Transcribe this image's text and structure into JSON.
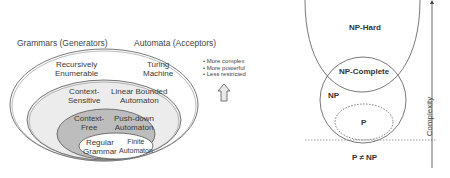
{
  "chomsky": {
    "header_grammars": "Grammars (Generators)",
    "header_automata": "Automata (Acceptors)",
    "levels": [
      {
        "grammar": [
          "Recursively",
          "Enumerable"
        ],
        "automaton": [
          "Turing",
          "Machine"
        ],
        "fill": "#ffffff"
      },
      {
        "grammar": [
          "Context-",
          "Sensitive"
        ],
        "automaton": [
          "Linear Bounded",
          "Automaton"
        ],
        "fill": "#ececec"
      },
      {
        "grammar": [
          "Context-",
          "Free"
        ],
        "automaton": [
          "Push-down",
          "Automaton"
        ],
        "fill": "#bdbdbd"
      },
      {
        "grammar": [
          "Regular",
          "Grammar"
        ],
        "automaton": [
          "Finite",
          "Automaton"
        ],
        "fill": "#ffffff"
      }
    ],
    "legend": {
      "bullets": [
        "More complex",
        "More powerful",
        "Less restricted"
      ],
      "arrow": "up-arrow"
    }
  },
  "complexity": {
    "np_hard": "NP-Hard",
    "np_complete": "NP-Complete",
    "np": "NP",
    "p": "P",
    "caption": "P ≠ NP",
    "axis_label": "Complexity"
  }
}
